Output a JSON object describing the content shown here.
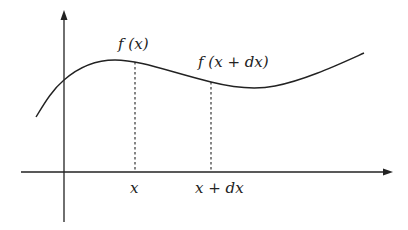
{
  "diagram": {
    "type": "function-curve-differential",
    "labels": {
      "fx_top": "f (x)",
      "fxdx_top": "f (x + dx)",
      "x_tick": "x",
      "xdx_tick": "x + dx"
    },
    "colors": {
      "stroke": "#222222",
      "background": "#ffffff"
    },
    "axes": {
      "x_arrow": true,
      "y_arrow": true
    },
    "dashed_lines": [
      "x",
      "x + dx"
    ]
  }
}
